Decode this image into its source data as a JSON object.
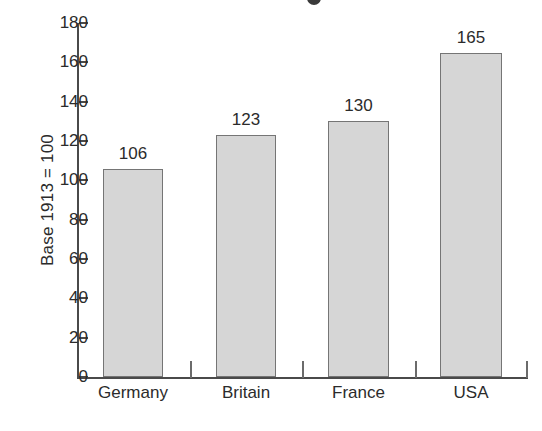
{
  "chart_data": {
    "type": "bar",
    "title": "",
    "xlabel": "",
    "ylabel": "Base 1913 = 100",
    "categories": [
      "Germany",
      "Britain",
      "France",
      "USA"
    ],
    "values": [
      106,
      123,
      130,
      165
    ],
    "value_labels": [
      "106",
      "123",
      "130",
      "165"
    ],
    "ylim": [
      0,
      180
    ],
    "ytick_values": [
      0,
      20,
      40,
      60,
      80,
      100,
      120,
      140,
      160,
      180
    ],
    "ytick_labels": [
      "0",
      "20",
      "40",
      "60",
      "80",
      "100",
      "120",
      "140",
      "160",
      "180"
    ],
    "grid": false,
    "legend": null,
    "bar_fill_color": "#d6d6d6",
    "bar_border_color": "#757575",
    "axis_color": "#4a4a4a",
    "text_color": "#2b2b2b",
    "background_color": "#ffffff"
  }
}
